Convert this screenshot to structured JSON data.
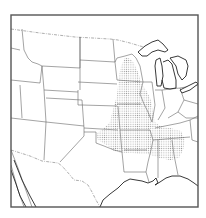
{
  "map": {
    "title": "",
    "region": "Central and Eastern United States",
    "frame": {
      "x": 11,
      "y": 15,
      "width": 187,
      "height": 192
    },
    "colors": {
      "background": "#ffffff",
      "frame": "#555555",
      "state_lines": "#666666",
      "coastline": "#222222",
      "stipple_dot": "#9a9a9a"
    },
    "layers": [
      {
        "id": "state-boundaries",
        "label": "State boundaries"
      },
      {
        "id": "coastline-and-lakes",
        "label": "Coastline and Great Lakes"
      },
      {
        "id": "international-border",
        "label": "US–Canada / US–Mexico border"
      },
      {
        "id": "shaded-range",
        "label": "Stippled distribution area"
      }
    ],
    "shaded_area": {
      "pattern": "stipple",
      "covers": [
        "Minnesota (south-east)",
        "Wisconsin (west)",
        "Iowa",
        "Missouri",
        "Illinois",
        "Kansas (east)",
        "Oklahoma (east)",
        "Arkansas",
        "Tennessee",
        "Kentucky (west)",
        "Mississippi (north)",
        "Alabama",
        "Georgia (west)"
      ]
    }
  }
}
